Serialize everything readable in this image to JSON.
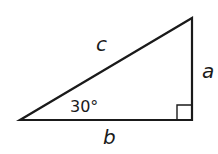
{
  "diagram": {
    "type": "right-triangle",
    "stroke_color": "#1a1a1a",
    "background": "#ffffff",
    "vertices": {
      "left": [
        20,
        120
      ],
      "right_angle": [
        192,
        120
      ],
      "top": [
        192,
        18
      ]
    },
    "right_angle_marker_size": 15,
    "labels": {
      "hypotenuse": "c",
      "vertical_leg": "a",
      "horizontal_leg": "b",
      "angle": "30°"
    }
  }
}
